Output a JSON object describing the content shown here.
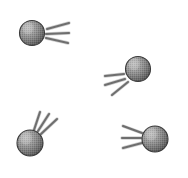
{
  "image": {
    "title": "Comet particles with motion trails",
    "width": 188,
    "height": 178,
    "background_color": "#ffffff",
    "style": "grayscale halftone dithered raster illustration",
    "object_count": 4,
    "line_color": "#6e6e6e",
    "sphere_outline_color": "#3a3a3a",
    "sphere_light_color": "#b8b8b8",
    "sphere_mid_color": "#8d8d8d",
    "sphere_dark_color": "#5c5c5c"
  },
  "objects": [
    {
      "id": "particle-1",
      "label": "Top-left particle",
      "sphere": {
        "cx": 32,
        "cy": 33,
        "r": 12.5
      },
      "highlight": {
        "cx": 28,
        "cy": 28,
        "r": 9
      },
      "trail_direction": "right",
      "trail_count": 3,
      "trails": [
        {
          "x1": 47,
          "y1": 29,
          "x2": 69,
          "y2": 23
        },
        {
          "x1": 46,
          "y1": 34,
          "x2": 69,
          "y2": 33
        },
        {
          "x1": 46,
          "y1": 38,
          "x2": 68,
          "y2": 43
        }
      ]
    },
    {
      "id": "particle-2",
      "label": "Middle-right particle",
      "sphere": {
        "cx": 138,
        "cy": 69,
        "r": 12.5
      },
      "highlight": {
        "cx": 134,
        "cy": 64,
        "r": 9
      },
      "trail_direction": "down-left",
      "trail_count": 3,
      "trails": [
        {
          "x1": 124,
          "y1": 74,
          "x2": 105,
          "y2": 76
        },
        {
          "x1": 125,
          "y1": 79,
          "x2": 105,
          "y2": 85
        },
        {
          "x1": 128,
          "y1": 82,
          "x2": 112,
          "y2": 95
        }
      ]
    },
    {
      "id": "particle-3",
      "label": "Bottom-left particle",
      "sphere": {
        "cx": 30,
        "cy": 143,
        "r": 13
      },
      "highlight": {
        "cx": 26,
        "cy": 138,
        "r": 9.5
      },
      "trail_direction": "up-right",
      "trail_count": 3,
      "trails": [
        {
          "x1": 34,
          "y1": 130,
          "x2": 40,
          "y2": 112
        },
        {
          "x1": 38,
          "y1": 131,
          "x2": 49,
          "y2": 114
        },
        {
          "x1": 41,
          "y1": 134,
          "x2": 57,
          "y2": 119
        }
      ]
    },
    {
      "id": "particle-4",
      "label": "Bottom-right particle",
      "sphere": {
        "cx": 155,
        "cy": 139,
        "r": 13
      },
      "highlight": {
        "cx": 151,
        "cy": 134,
        "r": 9.5
      },
      "trail_direction": "left",
      "trail_count": 3,
      "trails": [
        {
          "x1": 142,
          "y1": 133,
          "x2": 123,
          "y2": 126
        },
        {
          "x1": 141,
          "y1": 138,
          "x2": 122,
          "y2": 138
        },
        {
          "x1": 142,
          "y1": 143,
          "x2": 123,
          "y2": 148
        }
      ]
    }
  ]
}
